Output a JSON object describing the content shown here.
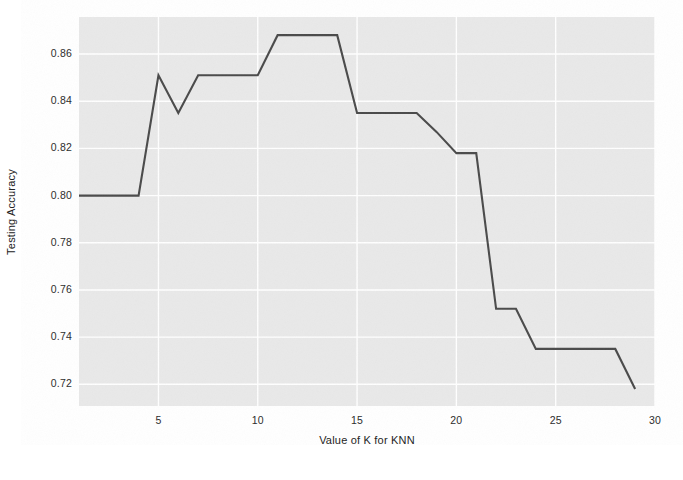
{
  "chart_data": {
    "type": "line",
    "title": "",
    "xlabel": "Value of K for KNN",
    "ylabel": "Testing Accuracy",
    "xlim": [
      1,
      30
    ],
    "ylim": [
      0.7108,
      0.8757
    ],
    "xticks": [
      5,
      10,
      15,
      20,
      25,
      30
    ],
    "yticks": [
      0.72,
      0.74,
      0.76,
      0.78,
      0.8,
      0.82,
      0.84,
      0.86
    ],
    "ytick_labels": [
      "0.72",
      "0.74",
      "0.76",
      "0.78",
      "0.80",
      "0.82",
      "0.84",
      "0.86"
    ],
    "xtick_labels": [
      "5",
      "10",
      "15",
      "20",
      "25",
      "30"
    ],
    "grid": true,
    "legend": null,
    "line_color": "#4a4a4a",
    "line_width": 2.1,
    "plot_background": "#e9e9e9",
    "grid_color": "#ffffff",
    "figure_background": "#ffffff",
    "x": [
      1,
      2,
      3,
      4,
      5,
      6,
      7,
      8,
      9,
      10,
      11,
      12,
      13,
      14,
      15,
      16,
      17,
      18,
      19,
      20,
      21,
      22,
      23,
      24,
      25,
      26,
      27,
      28,
      29
    ],
    "values": [
      0.8,
      0.8,
      0.8,
      0.8,
      0.851,
      0.835,
      0.851,
      0.851,
      0.851,
      0.851,
      0.868,
      0.868,
      0.868,
      0.868,
      0.835,
      0.835,
      0.835,
      0.835,
      0.827,
      0.818,
      0.818,
      0.752,
      0.752,
      0.735,
      0.735,
      0.735,
      0.735,
      0.735,
      0.718
    ],
    "series": [
      {
        "name": "Testing Accuracy",
        "values": [
          0.8,
          0.8,
          0.8,
          0.8,
          0.851,
          0.835,
          0.851,
          0.851,
          0.851,
          0.851,
          0.868,
          0.868,
          0.868,
          0.868,
          0.835,
          0.835,
          0.835,
          0.835,
          0.827,
          0.818,
          0.818,
          0.752,
          0.752,
          0.735,
          0.735,
          0.735,
          0.735,
          0.735,
          0.718
        ]
      }
    ]
  }
}
